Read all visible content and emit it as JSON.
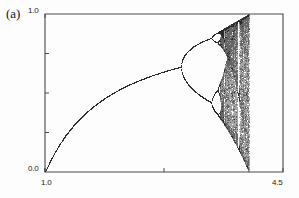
{
  "figure": {
    "panel_label": "(a)",
    "background_color": "#fdfdfd",
    "ink_color": "#2b2b2b",
    "axis_color": "#4a4a4a"
  },
  "axes": {
    "x_tick_labels": [
      "1.0",
      "4.5"
    ],
    "y_tick_labels": [
      "0.0",
      "1.0"
    ],
    "x_min_label": "1.0",
    "x_max_label": "4.5",
    "y_min_label": "0.0",
    "y_max_label": "1.0",
    "frame": {
      "left": 45,
      "right": 283,
      "top": 14,
      "bottom": 172
    }
  },
  "chart_data": {
    "type": "scatter",
    "title": "",
    "subtitle": "",
    "xlabel": "",
    "ylabel": "",
    "annotations": [
      "(a)"
    ],
    "legend": [],
    "legend_position": "none",
    "grid": false,
    "xlim": [
      1.0,
      4.5
    ],
    "ylim": [
      0.0,
      1.0
    ],
    "xticks": [
      1.0,
      4.5
    ],
    "yticks": [
      0.0,
      1.0
    ],
    "map": "logistic",
    "map_formula": "x_{n+1} = r * x_n * (1 - x_n)",
    "parameter_symbol": "r",
    "parameter_range": [
      1.0,
      4.5
    ],
    "state_range": [
      0.0,
      1.0
    ],
    "iterations_discarded": 300,
    "iterations_plotted": 160,
    "parameter_samples": 900,
    "chaos_cutoff_r": 4.0,
    "bifurcation_points": [
      {
        "r": 3.0,
        "period_from": 1,
        "period_to": 2
      },
      {
        "r": 3.449,
        "period_from": 2,
        "period_to": 4
      },
      {
        "r": 3.544,
        "period_from": 4,
        "period_to": 8
      },
      {
        "r": 3.564,
        "period_from": 8,
        "period_to": 16
      },
      {
        "r": 3.5699,
        "period_from": 16,
        "period_to": "chaos"
      }
    ],
    "periodic_windows": [
      {
        "r_start": 3.627,
        "r_end": 3.635,
        "period": 6
      },
      {
        "r_start": 3.738,
        "r_end": 3.745,
        "period": 5
      },
      {
        "r_start": 3.8284,
        "r_end": 3.8415,
        "period": 3
      }
    ],
    "fixed_point_branch": {
      "formula": "x* = 1 - 1/r",
      "r_start": 1.0,
      "r_end": 3.0,
      "x_start": 0.0,
      "x_end": 0.6667
    }
  }
}
